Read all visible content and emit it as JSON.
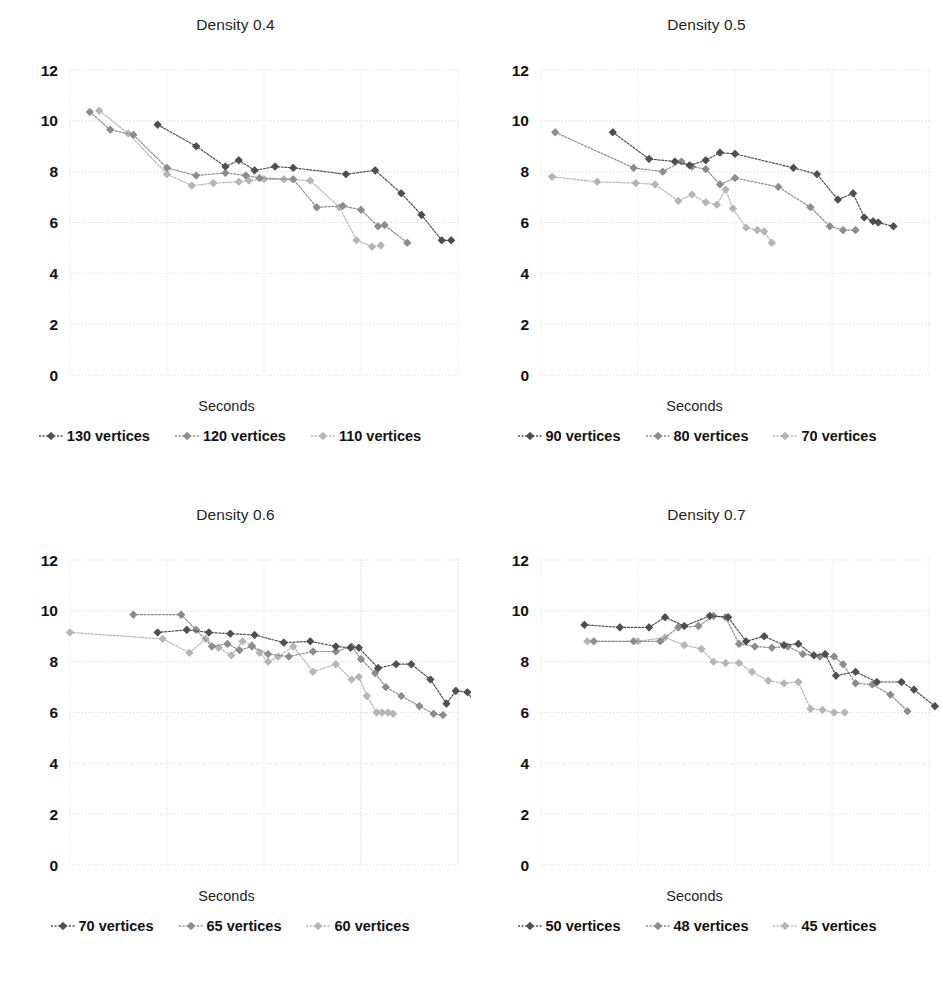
{
  "figure": {
    "background": "#ffffff",
    "panel_count": 4,
    "series_colors": [
      "#4f4f4f",
      "#8c8c8c",
      "#b5b5b5"
    ],
    "marker": "diamond",
    "line_style": "dotted"
  },
  "chart_data": [
    {
      "type": "line",
      "title": "Density 0.4",
      "xlabel": "Seconds",
      "ylabel": "",
      "xscale": "log",
      "xlim": [
        0.1,
        1000
      ],
      "ylim": [
        0,
        12
      ],
      "xticks": [
        "0.1",
        "1",
        "10",
        "100",
        "1000"
      ],
      "yticks": [
        "0",
        "2",
        "4",
        "6",
        "8",
        "10",
        "12"
      ],
      "grid": true,
      "legend": "bottom",
      "series": [
        {
          "name": "130 vertices",
          "color": "#4f4f4f",
          "points": [
            [
              0.8,
              9.85
            ],
            [
              2.0,
              9.0
            ],
            [
              4.0,
              8.2
            ],
            [
              5.5,
              8.45
            ],
            [
              8.0,
              8.05
            ],
            [
              13.0,
              8.2
            ],
            [
              20.0,
              8.15
            ],
            [
              70.0,
              7.9
            ],
            [
              140.0,
              8.05
            ],
            [
              260.0,
              7.15
            ],
            [
              420.0,
              6.3
            ],
            [
              680.0,
              5.3
            ],
            [
              850.0,
              5.3
            ]
          ]
        },
        {
          "name": "120 vertices",
          "color": "#8c8c8c",
          "points": [
            [
              0.16,
              10.35
            ],
            [
              0.26,
              9.65
            ],
            [
              0.45,
              9.45
            ],
            [
              1.0,
              8.15
            ],
            [
              2.0,
              7.85
            ],
            [
              4.0,
              7.95
            ],
            [
              6.5,
              7.85
            ],
            [
              9.0,
              7.75
            ],
            [
              20.0,
              7.7
            ],
            [
              35.0,
              6.6
            ],
            [
              65.0,
              6.65
            ],
            [
              100.0,
              6.5
            ],
            [
              150.0,
              5.85
            ],
            [
              175.0,
              5.9
            ],
            [
              300.0,
              5.2
            ]
          ]
        },
        {
          "name": "110 vertices",
          "color": "#b5b5b5",
          "points": [
            [
              0.2,
              10.4
            ],
            [
              0.4,
              9.5
            ],
            [
              1.0,
              7.9
            ],
            [
              1.8,
              7.45
            ],
            [
              3.0,
              7.55
            ],
            [
              5.5,
              7.6
            ],
            [
              7.0,
              7.65
            ],
            [
              10.0,
              7.7
            ],
            [
              16.0,
              7.7
            ],
            [
              30.0,
              7.65
            ],
            [
              60.0,
              6.6
            ],
            [
              90.0,
              5.3
            ],
            [
              130.0,
              5.05
            ],
            [
              160.0,
              5.1
            ]
          ]
        }
      ]
    },
    {
      "type": "line",
      "title": "Density 0.5",
      "xlabel": "Seconds",
      "ylabel": "",
      "xscale": "log",
      "xlim": [
        0.1,
        1000
      ],
      "ylim": [
        0,
        12
      ],
      "xticks": [
        "0.1",
        "1",
        "10",
        "100",
        "1000"
      ],
      "yticks": [
        "0",
        "2",
        "4",
        "6",
        "8",
        "10",
        "12"
      ],
      "grid": true,
      "legend": "bottom",
      "series": [
        {
          "name": "90 vertices",
          "color": "#4f4f4f",
          "points": [
            [
              0.55,
              9.55
            ],
            [
              1.3,
              8.5
            ],
            [
              2.4,
              8.4
            ],
            [
              3.4,
              8.25
            ],
            [
              5.0,
              8.45
            ],
            [
              7.0,
              8.75
            ],
            [
              10.0,
              8.7
            ],
            [
              40.0,
              8.15
            ],
            [
              70.0,
              7.9
            ],
            [
              115.0,
              6.9
            ],
            [
              165.0,
              7.15
            ],
            [
              215.0,
              6.2
            ],
            [
              265.0,
              6.05
            ],
            [
              300.0,
              6.0
            ],
            [
              430.0,
              5.85
            ]
          ]
        },
        {
          "name": "80 vertices",
          "color": "#8c8c8c",
          "points": [
            [
              0.14,
              9.55
            ],
            [
              0.9,
              8.15
            ],
            [
              1.8,
              8.0
            ],
            [
              2.8,
              8.4
            ],
            [
              3.6,
              8.2
            ],
            [
              5.0,
              8.1
            ],
            [
              7.0,
              7.5
            ],
            [
              10.0,
              7.75
            ],
            [
              28.0,
              7.4
            ],
            [
              60.0,
              6.6
            ],
            [
              95.0,
              5.85
            ],
            [
              130.0,
              5.7
            ],
            [
              175.0,
              5.7
            ]
          ]
        },
        {
          "name": "70 vertices",
          "color": "#b5b5b5",
          "points": [
            [
              0.13,
              7.8
            ],
            [
              0.38,
              7.6
            ],
            [
              0.95,
              7.55
            ],
            [
              1.5,
              7.5
            ],
            [
              2.6,
              6.85
            ],
            [
              3.6,
              7.1
            ],
            [
              5.0,
              6.8
            ],
            [
              6.5,
              6.7
            ],
            [
              8.0,
              7.3
            ],
            [
              9.5,
              6.55
            ],
            [
              13.0,
              5.8
            ],
            [
              17.0,
              5.7
            ],
            [
              20.0,
              5.65
            ],
            [
              24.0,
              5.2
            ]
          ]
        }
      ]
    },
    {
      "type": "line",
      "title": "Density 0.6",
      "xlabel": "Seconds",
      "ylabel": "",
      "xscale": "log",
      "xlim": [
        0.1,
        1000
      ],
      "ylim": [
        0,
        12
      ],
      "xticks": [
        "0.1",
        "1",
        "10",
        "100",
        "1000"
      ],
      "yticks": [
        "0",
        "2",
        "4",
        "6",
        "8",
        "10",
        "12"
      ],
      "grid": true,
      "legend": "bottom",
      "series": [
        {
          "name": "70 vertices",
          "color": "#4f4f4f",
          "points": [
            [
              0.8,
              9.15
            ],
            [
              1.6,
              9.25
            ],
            [
              2.7,
              9.15
            ],
            [
              4.5,
              9.1
            ],
            [
              8.0,
              9.05
            ],
            [
              16.0,
              8.75
            ],
            [
              30.0,
              8.8
            ],
            [
              55.0,
              8.6
            ],
            [
              78.0,
              8.55
            ],
            [
              95.0,
              8.55
            ],
            [
              150.0,
              7.75
            ],
            [
              230.0,
              7.9
            ],
            [
              330.0,
              7.9
            ],
            [
              520.0,
              7.3
            ],
            [
              760.0,
              6.35
            ],
            [
              950.0,
              6.85
            ],
            [
              1250.0,
              6.8
            ],
            [
              1650.0,
              6.15
            ]
          ]
        },
        {
          "name": "65 vertices",
          "color": "#8c8c8c",
          "points": [
            [
              0.45,
              9.85
            ],
            [
              1.4,
              9.85
            ],
            [
              2.0,
              9.25
            ],
            [
              2.9,
              8.6
            ],
            [
              4.2,
              8.7
            ],
            [
              5.6,
              8.45
            ],
            [
              7.5,
              8.6
            ],
            [
              11.0,
              8.3
            ],
            [
              18.0,
              8.2
            ],
            [
              32.0,
              8.4
            ],
            [
              55.0,
              8.4
            ],
            [
              80.0,
              8.6
            ],
            [
              100.0,
              8.1
            ],
            [
              140.0,
              7.55
            ],
            [
              180.0,
              7.0
            ],
            [
              260.0,
              6.65
            ],
            [
              400.0,
              6.25
            ],
            [
              560.0,
              5.95
            ],
            [
              700.0,
              5.9
            ]
          ]
        },
        {
          "name": "60 vertices",
          "color": "#b5b5b5",
          "points": [
            [
              0.1,
              9.15
            ],
            [
              0.9,
              8.9
            ],
            [
              1.7,
              8.35
            ],
            [
              2.5,
              8.9
            ],
            [
              3.4,
              8.55
            ],
            [
              4.6,
              8.25
            ],
            [
              6.0,
              8.8
            ],
            [
              7.5,
              8.65
            ],
            [
              9.0,
              8.35
            ],
            [
              11.0,
              8.0
            ],
            [
              14.0,
              8.2
            ],
            [
              20.0,
              8.6
            ],
            [
              32.0,
              7.6
            ],
            [
              55.0,
              7.9
            ],
            [
              80.0,
              7.3
            ],
            [
              95.0,
              7.4
            ],
            [
              115.0,
              6.65
            ],
            [
              145.0,
              6.0
            ],
            [
              165.0,
              6.0
            ],
            [
              190.0,
              6.0
            ],
            [
              215.0,
              5.95
            ]
          ]
        }
      ]
    },
    {
      "type": "line",
      "title": "Density 0.7",
      "xlabel": "Seconds",
      "ylabel": "",
      "xscale": "log",
      "xlim": [
        0.1,
        1000
      ],
      "ylim": [
        0,
        12
      ],
      "xticks": [
        "0.1",
        "1",
        "10",
        "100",
        "1000"
      ],
      "yticks": [
        "0",
        "2",
        "4",
        "6",
        "8",
        "10",
        "12"
      ],
      "grid": true,
      "legend": "bottom",
      "series": [
        {
          "name": "50 vertices",
          "color": "#4f4f4f",
          "points": [
            [
              0.28,
              9.45
            ],
            [
              0.65,
              9.35
            ],
            [
              1.3,
              9.35
            ],
            [
              1.9,
              9.75
            ],
            [
              3.0,
              9.4
            ],
            [
              5.5,
              9.8
            ],
            [
              8.5,
              9.75
            ],
            [
              13.0,
              8.8
            ],
            [
              20.0,
              9.0
            ],
            [
              32.0,
              8.65
            ],
            [
              45.0,
              8.7
            ],
            [
              65.0,
              8.25
            ],
            [
              85.0,
              8.3
            ],
            [
              110.0,
              7.45
            ],
            [
              175.0,
              7.6
            ],
            [
              290.0,
              7.2
            ],
            [
              520.0,
              7.2
            ],
            [
              700.0,
              6.9
            ],
            [
              1150.0,
              6.25
            ]
          ]
        },
        {
          "name": "48 vertices",
          "color": "#8c8c8c",
          "points": [
            [
              0.35,
              8.8
            ],
            [
              0.9,
              8.8
            ],
            [
              1.7,
              8.8
            ],
            [
              2.6,
              9.35
            ],
            [
              4.2,
              9.4
            ],
            [
              6.0,
              9.8
            ],
            [
              8.0,
              9.75
            ],
            [
              11.0,
              8.7
            ],
            [
              16.0,
              8.6
            ],
            [
              24.0,
              8.55
            ],
            [
              35.0,
              8.6
            ],
            [
              50.0,
              8.3
            ],
            [
              75.0,
              8.2
            ],
            [
              105.0,
              8.2
            ],
            [
              130.0,
              7.9
            ],
            [
              175.0,
              7.15
            ],
            [
              260.0,
              7.1
            ],
            [
              400.0,
              6.7
            ],
            [
              600.0,
              6.05
            ]
          ]
        },
        {
          "name": "45 vertices",
          "color": "#b5b5b5",
          "points": [
            [
              0.3,
              8.8
            ],
            [
              1.0,
              8.8
            ],
            [
              1.9,
              8.95
            ],
            [
              3.0,
              8.65
            ],
            [
              4.5,
              8.5
            ],
            [
              6.0,
              8.0
            ],
            [
              8.0,
              7.95
            ],
            [
              11.0,
              7.95
            ],
            [
              15.0,
              7.6
            ],
            [
              22.0,
              7.25
            ],
            [
              32.0,
              7.15
            ],
            [
              45.0,
              7.2
            ],
            [
              60.0,
              6.15
            ],
            [
              80.0,
              6.1
            ],
            [
              105.0,
              6.0
            ],
            [
              135.0,
              6.0
            ]
          ]
        }
      ]
    }
  ]
}
